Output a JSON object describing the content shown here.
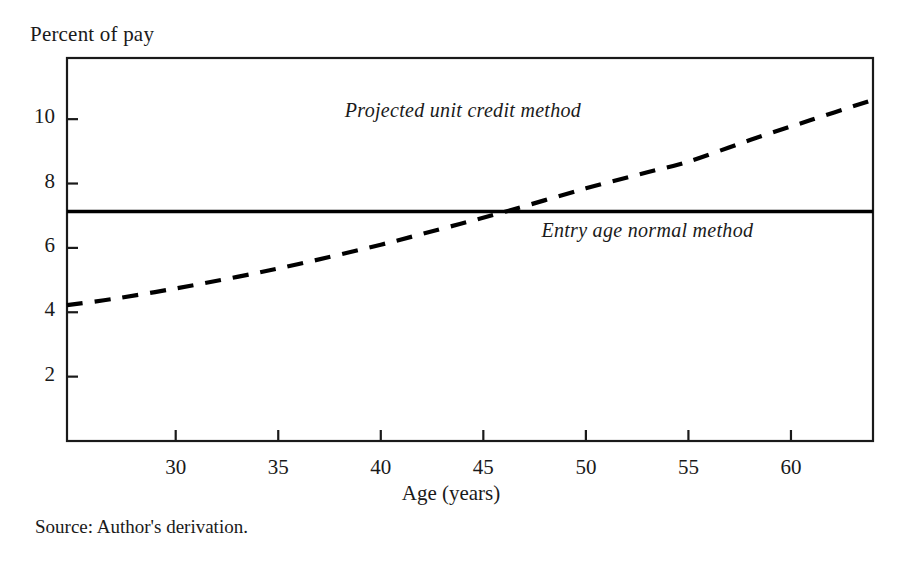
{
  "chart_data": {
    "type": "line",
    "title": "",
    "ylabel": "Percent of pay",
    "xlabel": "Age (years)",
    "source": "Source: Author's derivation.",
    "grid": false,
    "legend_position": "inline-annotations",
    "xlim": [
      24.7,
      64.0
    ],
    "ylim": [
      0.0,
      11.9
    ],
    "xticks": [
      30,
      35,
      40,
      45,
      50,
      55,
      60
    ],
    "xtick_labels": [
      "30",
      "35",
      "40",
      "45",
      "50",
      "55",
      "60"
    ],
    "yticks": [
      2,
      4,
      6,
      8,
      10
    ],
    "ytick_labels": [
      "2",
      "4",
      "6",
      "8",
      "10"
    ],
    "series": [
      {
        "name": "Projected unit credit method",
        "style": "dashed",
        "color": "#000000",
        "x": [
          24.7,
          27,
          30,
          33,
          36,
          40,
          43,
          46.1,
          50,
          53,
          55,
          58,
          61,
          64
        ],
        "values": [
          4.22,
          4.42,
          4.74,
          5.1,
          5.5,
          6.1,
          6.6,
          7.13,
          7.85,
          8.35,
          8.68,
          9.35,
          9.98,
          10.6
        ]
      },
      {
        "name": "Entry age normal method",
        "style": "solid",
        "color": "#000000",
        "x": [
          24.7,
          64.0
        ],
        "values": [
          7.13,
          7.13
        ]
      }
    ],
    "annotations": [
      {
        "text": "Projected unit credit method",
        "x": 44.0,
        "y": 10.2
      },
      {
        "text": "Entry age normal method",
        "x": 53.0,
        "y": 6.45
      }
    ],
    "crossover": {
      "x": 46.1,
      "y": 7.13
    }
  },
  "axes": {
    "frame_color": "#1a1a1a"
  }
}
